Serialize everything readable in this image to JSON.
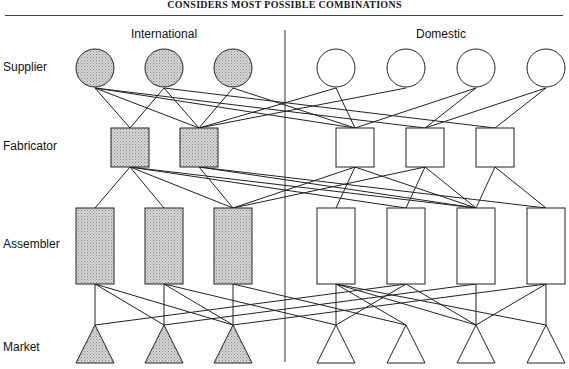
{
  "title": "CONSIDERS MOST POSSIBLE COMBINATIONS",
  "groups": {
    "international": "International",
    "domestic": "Domestic"
  },
  "tiers": {
    "supplier": "Supplier",
    "fabricator": "Fabricator",
    "assembler": "Assembler",
    "market": "Market"
  },
  "colors": {
    "international_fill": "#cfcfcf",
    "domestic_fill": "#ffffff",
    "stroke": "#222222"
  },
  "nodes": {
    "supplier": {
      "international": [
        95,
        164,
        233
      ],
      "domestic": [
        336,
        406,
        476,
        546
      ]
    },
    "fabricator": {
      "international": [
        130,
        199
      ],
      "domestic": [
        355,
        425,
        495
      ]
    },
    "assembler": {
      "international": [
        95,
        164,
        233
      ],
      "domestic": [
        336,
        406,
        476,
        546
      ]
    },
    "market": {
      "international": [
        95,
        164,
        233
      ],
      "domestic": [
        336,
        406,
        476,
        546
      ]
    }
  }
}
